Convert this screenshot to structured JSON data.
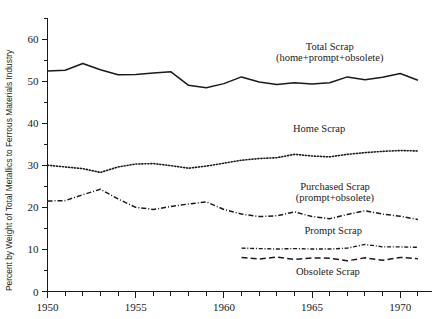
{
  "chart_data": {
    "type": "line",
    "title": "",
    "xlabel": "",
    "ylabel": "Percent by Weight of Total Metallics to Ferrous Materials Industry",
    "xlim": [
      1950,
      1971.8
    ],
    "ylim": [
      0,
      65
    ],
    "grid": false,
    "legend_position": "inline-annotations",
    "x_ticks_major": [
      "1950",
      "1955",
      "1960",
      "1965",
      "1970"
    ],
    "x_tick_values_major": [
      1950,
      1955,
      1960,
      1965,
      1970
    ],
    "x_ticks_minor": [
      1951,
      1952,
      1953,
      1954,
      1956,
      1957,
      1958,
      1959,
      1961,
      1962,
      1963,
      1964,
      1966,
      1967,
      1968,
      1969,
      1971
    ],
    "y_ticks_major": [
      "0",
      "10",
      "20",
      "30",
      "40",
      "50",
      "60"
    ],
    "y_tick_values_major": [
      0,
      10,
      20,
      30,
      40,
      50,
      60
    ],
    "y_ticks_minor": [
      5,
      15,
      25,
      35,
      45,
      55,
      65
    ],
    "series": [
      {
        "name": "Total Scrap",
        "label_line1": "Total Scrap",
        "label_line2": "(home+prompt+obsolete)",
        "style": "solid",
        "x": [
          1950,
          1951,
          1952,
          1953,
          1954,
          1955,
          1956,
          1957,
          1958,
          1959,
          1960,
          1961,
          1962,
          1963,
          1964,
          1965,
          1966,
          1967,
          1968,
          1969,
          1970,
          1971
        ],
        "values": [
          52.4,
          52.6,
          54.2,
          52.7,
          51.5,
          51.6,
          51.9,
          52.2,
          49.0,
          48.4,
          49.4,
          51.0,
          49.8,
          49.2,
          49.6,
          49.3,
          49.6,
          51.0,
          50.3,
          50.9,
          51.8,
          50.2
        ]
      },
      {
        "name": "Home Scrap",
        "label_line1": "Home Scrap",
        "label_line2": "",
        "style": "dotted",
        "x": [
          1950,
          1951,
          1952,
          1953,
          1954,
          1955,
          1956,
          1957,
          1958,
          1959,
          1960,
          1961,
          1962,
          1963,
          1964,
          1965,
          1966,
          1967,
          1968,
          1969,
          1970,
          1971
        ],
        "values": [
          30.0,
          29.6,
          29.2,
          28.3,
          29.6,
          30.3,
          30.4,
          29.9,
          29.3,
          29.8,
          30.5,
          31.2,
          31.6,
          31.8,
          32.6,
          32.2,
          32.0,
          32.6,
          33.0,
          33.3,
          33.5,
          33.4
        ]
      },
      {
        "name": "Purchased Scrap",
        "label_line1": "Purchased Scrap",
        "label_line2": "(prompt+obsolete)",
        "style": "dashdot",
        "x": [
          1950,
          1951,
          1952,
          1953,
          1954,
          1955,
          1956,
          1957,
          1958,
          1959,
          1960,
          1961,
          1962,
          1963,
          1964,
          1965,
          1966,
          1967,
          1968,
          1969,
          1970,
          1971
        ],
        "values": [
          21.5,
          21.6,
          23.0,
          24.3,
          22.0,
          20.0,
          19.5,
          20.2,
          20.8,
          21.3,
          19.5,
          18.4,
          17.8,
          18.0,
          18.9,
          17.8,
          17.3,
          18.3,
          19.2,
          18.4,
          17.9,
          17.1
        ]
      },
      {
        "name": "Prompt Scrap",
        "label_line1": "Prompt  Scrap",
        "label_line2": "",
        "style": "dashdot-thin",
        "x": [
          1961,
          1962,
          1963,
          1964,
          1965,
          1966,
          1967,
          1968,
          1969,
          1970,
          1971
        ],
        "values": [
          10.3,
          10.2,
          10.1,
          10.2,
          10.1,
          10.1,
          10.3,
          11.2,
          10.6,
          10.6,
          10.5
        ]
      },
      {
        "name": "Obsolete Scrap",
        "label_line1": "Obsolete Scrap",
        "label_line2": "",
        "style": "dashed",
        "x": [
          1961,
          1962,
          1963,
          1964,
          1965,
          1966,
          1967,
          1968,
          1969,
          1970,
          1971
        ],
        "values": [
          8.1,
          7.7,
          8.2,
          7.6,
          8.0,
          7.9,
          7.3,
          8.0,
          7.4,
          8.1,
          7.8
        ]
      }
    ],
    "annotations": [
      {
        "text": "Total Scrap",
        "x": 1966.0,
        "y": 57.5
      },
      {
        "text": "(home+prompt+obsolete)",
        "x": 1966.0,
        "y": 54.8
      },
      {
        "text": "Home Scrap",
        "x": 1965.4,
        "y": 37.9
      },
      {
        "text": "Purchased Scrap",
        "x": 1966.3,
        "y": 24.2
      },
      {
        "text": "(prompt+obsolete)",
        "x": 1966.3,
        "y": 21.6
      },
      {
        "text": "Prompt  Scrap",
        "x": 1966.2,
        "y": 13.6
      },
      {
        "text": "Obsolete Scrap",
        "x": 1965.9,
        "y": 4.0
      }
    ]
  }
}
